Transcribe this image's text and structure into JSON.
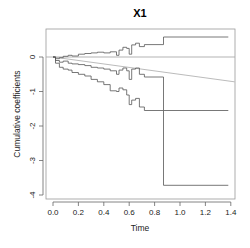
{
  "chart_data": {
    "type": "line",
    "subtype": "step",
    "title": "X1",
    "xlabel": "Time",
    "ylabel": "Cumulative coefficients",
    "xlim": [
      -0.04,
      1.43
    ],
    "ylim": [
      -4.1,
      0.82
    ],
    "xticks": [
      0.0,
      0.2,
      0.4,
      0.6,
      0.8,
      1.0,
      1.2,
      1.4
    ],
    "xtick_labels": [
      "0.0",
      "0.2",
      "0.4",
      "0.6",
      "0.8",
      "1.0",
      "1.2",
      "1.4"
    ],
    "yticks": [
      0,
      -1,
      -2,
      -3,
      -4
    ],
    "ytick_labels": [
      "0",
      "-1",
      "-2",
      "-3",
      "-4"
    ],
    "grid": false,
    "legend": null,
    "reference_lines": [
      {
        "name": "zero",
        "type": "hline",
        "y": 0,
        "color": "#aaaaaa"
      },
      {
        "name": "trend",
        "type": "segment",
        "x0": 0.0,
        "y0": 0.0,
        "x1": 1.43,
        "y1": -0.72,
        "color": "#aaaaaa"
      }
    ],
    "series": [
      {
        "name": "upper confidence band",
        "color": "#555555",
        "x": [
          0.0,
          0.02,
          0.05,
          0.08,
          0.12,
          0.15,
          0.2,
          0.25,
          0.3,
          0.35,
          0.4,
          0.45,
          0.5,
          0.52,
          0.55,
          0.58,
          0.6,
          0.62,
          0.65,
          0.68,
          0.72,
          0.87,
          0.87,
          1.38
        ],
        "y": [
          0.0,
          -0.05,
          -0.02,
          0.02,
          0.05,
          0.03,
          0.08,
          0.1,
          0.12,
          0.14,
          0.12,
          0.15,
          0.05,
          0.2,
          0.28,
          0.25,
          0.08,
          0.35,
          0.4,
          0.3,
          0.36,
          0.36,
          0.58,
          0.58
        ]
      },
      {
        "name": "cumulative coefficient estimate",
        "color": "#555555",
        "x": [
          0.0,
          0.02,
          0.05,
          0.08,
          0.12,
          0.15,
          0.2,
          0.25,
          0.3,
          0.35,
          0.4,
          0.45,
          0.5,
          0.52,
          0.55,
          0.58,
          0.6,
          0.62,
          0.65,
          0.68,
          0.72,
          0.87,
          0.87,
          1.38
        ],
        "y": [
          0.0,
          -0.1,
          -0.15,
          -0.12,
          -0.18,
          -0.2,
          -0.22,
          -0.25,
          -0.3,
          -0.32,
          -0.35,
          -0.4,
          -0.5,
          -0.38,
          -0.32,
          -0.4,
          -0.65,
          -0.35,
          -0.32,
          -0.5,
          -0.58,
          -0.58,
          -1.55,
          -1.55
        ]
      },
      {
        "name": "lower confidence band",
        "color": "#555555",
        "x": [
          0.0,
          0.02,
          0.05,
          0.08,
          0.12,
          0.15,
          0.2,
          0.25,
          0.3,
          0.35,
          0.4,
          0.45,
          0.5,
          0.52,
          0.55,
          0.58,
          0.6,
          0.62,
          0.65,
          0.68,
          0.72,
          0.87,
          0.87,
          1.38
        ],
        "y": [
          0.0,
          -0.18,
          -0.3,
          -0.35,
          -0.38,
          -0.45,
          -0.5,
          -0.55,
          -0.65,
          -0.72,
          -0.8,
          -0.98,
          -1.0,
          -0.9,
          -0.95,
          -1.1,
          -1.38,
          -1.25,
          -1.2,
          -1.45,
          -1.55,
          -1.55,
          -3.72,
          -3.72
        ]
      }
    ]
  }
}
